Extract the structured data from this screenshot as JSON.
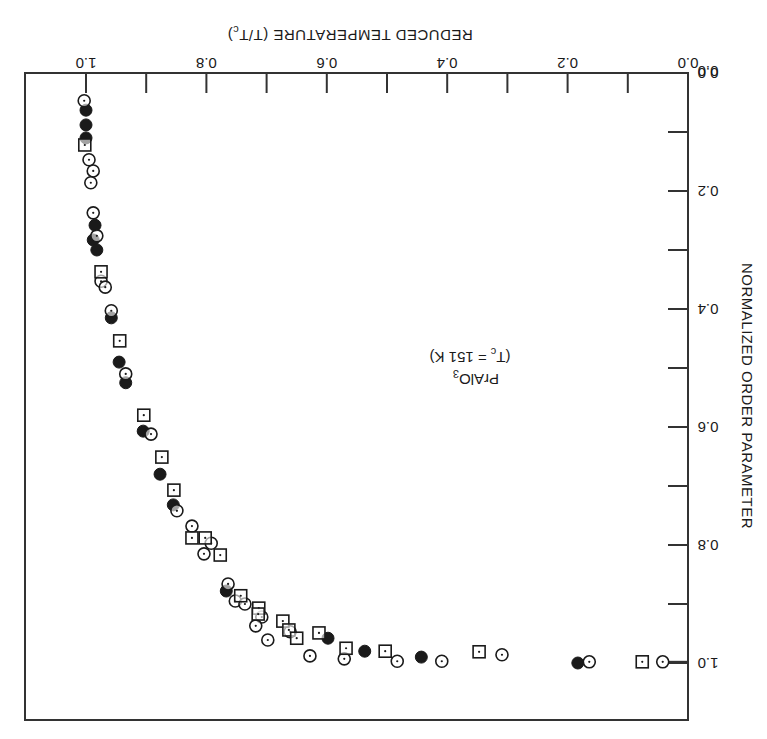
{
  "chart_data": {
    "type": "scatter",
    "orientation_note": "figure rendered rotated: x-axis labels upside-down along top (increasing right-to-left), y-axis labels along right edge reading top-to-bottom",
    "title": "",
    "xlabel": "REDUCED TEMPERATURE (T/T",
    "xlabel_sub": "c",
    "xlabel_tail": ")",
    "ylabel": "NORMALIZED ORDER PARAMETER",
    "x_ticks": [
      "1.0",
      "0.8",
      "0.6",
      "0.4",
      "0.2",
      "0.0"
    ],
    "y_ticks": [
      "0.0",
      "0.2",
      "0.4",
      "0.6",
      "0.8",
      "1.0"
    ],
    "origin_label": "0.0",
    "xlim": [
      0.0,
      1.1
    ],
    "ylim": [
      0.0,
      1.1
    ],
    "grid": false,
    "annotation": {
      "line1": "PrAlO",
      "line1_sub": "3",
      "line2_pre": "(T",
      "line2_sub": "c",
      "line2_post": " = 151 K)"
    },
    "series": [
      {
        "name": "filled circles",
        "marker": "filled-circle",
        "points": [
          [
            1.0,
            0.063
          ],
          [
            1.0,
            0.088
          ],
          [
            1.0,
            0.11
          ],
          [
            0.985,
            0.258
          ],
          [
            0.988,
            0.283
          ],
          [
            0.982,
            0.3
          ],
          [
            0.958,
            0.415
          ],
          [
            0.945,
            0.49
          ],
          [
            0.934,
            0.525
          ],
          [
            0.905,
            0.607
          ],
          [
            0.877,
            0.68
          ],
          [
            0.855,
            0.732
          ],
          [
            0.767,
            0.878
          ],
          [
            0.598,
            0.958
          ],
          [
            0.537,
            0.98
          ],
          [
            0.443,
            0.99
          ],
          [
            0.183,
            1.0
          ]
        ]
      },
      {
        "name": "open circles with dot",
        "marker": "dotted-circle",
        "points": [
          [
            1.003,
            0.047
          ],
          [
            0.995,
            0.147
          ],
          [
            0.988,
            0.166
          ],
          [
            0.992,
            0.186
          ],
          [
            0.988,
            0.237
          ],
          [
            0.982,
            0.276
          ],
          [
            0.975,
            0.353
          ],
          [
            0.968,
            0.363
          ],
          [
            0.958,
            0.403
          ],
          [
            0.934,
            0.51
          ],
          [
            0.892,
            0.612
          ],
          [
            0.849,
            0.742
          ],
          [
            0.824,
            0.768
          ],
          [
            0.792,
            0.797
          ],
          [
            0.804,
            0.815
          ],
          [
            0.764,
            0.866
          ],
          [
            0.752,
            0.895
          ],
          [
            0.736,
            0.9
          ],
          [
            0.708,
            0.922
          ],
          [
            0.718,
            0.937
          ],
          [
            0.698,
            0.961
          ],
          [
            0.661,
            0.947
          ],
          [
            0.628,
            0.988
          ],
          [
            0.571,
            0.993
          ],
          [
            0.483,
            0.997
          ],
          [
            0.409,
            0.997
          ],
          [
            0.309,
            0.986
          ],
          [
            0.164,
            0.998
          ],
          [
            0.042,
            0.998
          ]
        ]
      },
      {
        "name": "squares with dot",
        "marker": "dotted-square",
        "points": [
          [
            1.002,
            0.122
          ],
          [
            0.975,
            0.337
          ],
          [
            0.944,
            0.454
          ],
          [
            0.904,
            0.58
          ],
          [
            0.874,
            0.651
          ],
          [
            0.854,
            0.707
          ],
          [
            0.824,
            0.788
          ],
          [
            0.802,
            0.788
          ],
          [
            0.777,
            0.817
          ],
          [
            0.743,
            0.886
          ],
          [
            0.713,
            0.907
          ],
          [
            0.714,
            0.917
          ],
          [
            0.673,
            0.929
          ],
          [
            0.663,
            0.944
          ],
          [
            0.65,
            0.958
          ],
          [
            0.613,
            0.949
          ],
          [
            0.568,
            0.975
          ],
          [
            0.503,
            0.98
          ],
          [
            0.347,
            0.981
          ],
          [
            0.076,
            0.998
          ]
        ]
      }
    ],
    "connector": {
      "from": [
        0.0,
        1.0
      ],
      "to_marker_at": [
        0.042,
        0.998
      ]
    },
    "colors": {
      "ink": "#1a1a1a",
      "frame": "#333333",
      "background": "#ffffff"
    }
  }
}
